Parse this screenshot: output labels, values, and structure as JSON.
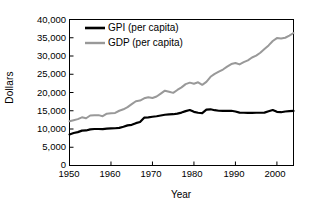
{
  "chart_data": {
    "type": "line",
    "title": "",
    "xlabel": "Year",
    "ylabel": "Dollars",
    "xlim": [
      1950,
      2004
    ],
    "ylim": [
      0,
      40000
    ],
    "grid": false,
    "legend_position": "top-left-inside",
    "xticks": [
      "1950",
      "1960",
      "1970",
      "1980",
      "1990",
      "2000"
    ],
    "xtick_values": [
      1950,
      1960,
      1970,
      1980,
      1990,
      2000
    ],
    "yticks": [
      "0",
      "5,000",
      "10,000",
      "15,000",
      "20,000",
      "25,000",
      "30,000",
      "35,000",
      "40,000"
    ],
    "ytick_values": [
      0,
      5000,
      10000,
      15000,
      20000,
      25000,
      30000,
      35000,
      40000
    ],
    "x": [
      1950,
      1951,
      1952,
      1953,
      1954,
      1955,
      1956,
      1957,
      1958,
      1959,
      1960,
      1961,
      1962,
      1963,
      1964,
      1965,
      1966,
      1967,
      1968,
      1969,
      1970,
      1971,
      1972,
      1973,
      1974,
      1975,
      1976,
      1977,
      1978,
      1979,
      1980,
      1981,
      1982,
      1983,
      1984,
      1985,
      1986,
      1987,
      1988,
      1989,
      1990,
      1991,
      1992,
      1993,
      1994,
      1995,
      1996,
      1997,
      1998,
      1999,
      2000,
      2001,
      2002,
      2003,
      2004
    ],
    "series": [
      {
        "name": "GPI (per capita)",
        "color": "#000000",
        "width": 2.2,
        "values": [
          8500,
          8900,
          9150,
          9550,
          9600,
          9900,
          10000,
          10000,
          9950,
          10100,
          10150,
          10200,
          10300,
          10600,
          11000,
          11150,
          11600,
          11900,
          13100,
          13200,
          13350,
          13500,
          13700,
          13900,
          14000,
          14050,
          14200,
          14500,
          14900,
          15200,
          14700,
          14450,
          14350,
          15300,
          15400,
          15150,
          15000,
          14950,
          14950,
          15000,
          14800,
          14500,
          14450,
          14400,
          14400,
          14450,
          14450,
          14500,
          14850,
          15200,
          14700,
          14600,
          14800,
          14900,
          14950
        ]
      },
      {
        "name": "GDP (per capita)",
        "color": "#999999",
        "width": 2.0,
        "values": [
          12100,
          12400,
          12700,
          13200,
          12950,
          13700,
          13800,
          13800,
          13500,
          14200,
          14300,
          14400,
          15000,
          15400,
          16000,
          16800,
          17600,
          17800,
          18400,
          18700,
          18500,
          18900,
          19700,
          20500,
          20200,
          19900,
          20700,
          21400,
          22300,
          22700,
          22400,
          22800,
          22100,
          22900,
          24300,
          25100,
          25700,
          26300,
          27100,
          27800,
          28100,
          27700,
          28300,
          28800,
          29600,
          30100,
          30900,
          31900,
          32900,
          34100,
          34900,
          34800,
          35000,
          35600,
          36300
        ]
      }
    ]
  },
  "axis": {
    "ylabel": "Dollars",
    "xlabel": "Year"
  }
}
